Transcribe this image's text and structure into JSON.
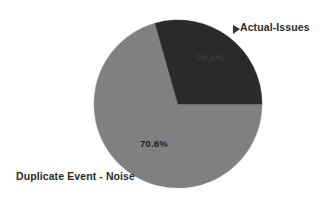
{
  "chart_data": {
    "type": "pie",
    "title": "",
    "subtitle": "",
    "xlabel": "",
    "ylabel": "",
    "grid": false,
    "legend_position": "none",
    "labels_position": "outside-callout",
    "unit": "%",
    "total": 100.0,
    "categories": [
      "Actual-Issues",
      "Duplicate Event - Noise"
    ],
    "values": [
      29.4,
      70.6
    ],
    "value_labels": [
      "29.4%",
      "70.6%"
    ],
    "colors": [
      "#2a2a2a",
      "#808080"
    ],
    "start_angle_deg": 0,
    "direction": "counterclockwise",
    "slices": [
      {
        "name": "Actual-Issues",
        "value": 29.4,
        "value_label": "29.4%",
        "color": "#2a2a2a",
        "label_text": "Actual-Issues",
        "label_placement": "outside-top-right",
        "start_angle_deg": 0,
        "end_angle_deg": 105.8
      },
      {
        "name": "Duplicate Event - Noise",
        "value": 70.6,
        "value_label": "70.6%",
        "color": "#808080",
        "label_text": "Duplicate Event - Noise",
        "label_placement": "outside-bottom-left",
        "start_angle_deg": 105.8,
        "end_angle_deg": 360
      }
    ]
  },
  "figure": {
    "background_color": "#ffffff",
    "text_color": "#2b2b2b",
    "pie_center_x": 178,
    "pie_center_y": 104,
    "pie_radius": 84
  },
  "labels": {
    "actual_issues": "Actual-Issues",
    "duplicate_noise": "Duplicate Event - Noise",
    "actual_issues_value": "29.4%",
    "duplicate_noise_value": "70.6%"
  }
}
